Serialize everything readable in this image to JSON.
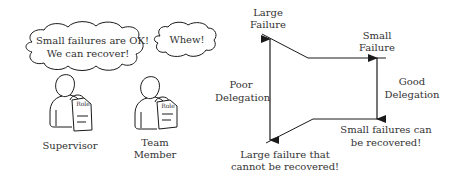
{
  "left_scene": {
    "supervisor": {
      "speech": [
        "Small failures are OK!",
        "We can recover!"
      ],
      "role_tag": "Role",
      "label": "Supervisor"
    },
    "team_member": {
      "speech": [
        "Whew!"
      ],
      "role_tag": "Role",
      "label": [
        "Team",
        "Member"
      ]
    }
  },
  "right_diagram": {
    "large_failure": [
      "Large",
      "Failure"
    ],
    "small_failure": [
      "Small",
      "Failure"
    ],
    "poor_delegation": [
      "Poor",
      "Delegation"
    ],
    "good_delegation": [
      "Good",
      "Delegation"
    ],
    "large_unrecoverable": [
      "Large failure that",
      "cannot be recovered!"
    ],
    "small_recoverable": [
      "Small failures can",
      "be recovered!"
    ]
  },
  "colors": {
    "stroke": "#1a1a1a",
    "text": "#333333",
    "background": "#ffffff"
  }
}
